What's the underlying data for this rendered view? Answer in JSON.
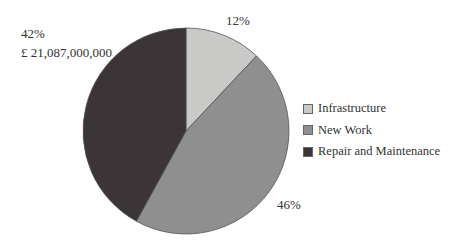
{
  "chart_data": {
    "type": "pie",
    "title": "",
    "categories": [
      "Infrastructure",
      "New Work",
      "Repair and Maintenance"
    ],
    "values": [
      12,
      46,
      42
    ],
    "units": "%",
    "colors": [
      "#c9c9c7",
      "#8f8f8f",
      "#3b3537"
    ],
    "annotations": [
      {
        "slice": "Infrastructure",
        "text": "12%"
      },
      {
        "slice": "New Work",
        "text": "46%"
      },
      {
        "slice": "Repair and Maintenance",
        "text": "42%",
        "subtext": "£ 21,087,000,000"
      }
    ],
    "start_angle": "12 o'clock",
    "direction": "clockwise",
    "legend_position": "right"
  },
  "labels": {
    "infrastructure_pct": "12%",
    "new_work_pct": "46%",
    "repair_pct": "42%",
    "repair_value": "£ 21,087,000,000"
  },
  "legend": {
    "items": [
      {
        "label": "Infrastructure",
        "color": "#c9c9c7"
      },
      {
        "label": "New Work",
        "color": "#8f8f8f"
      },
      {
        "label": "Repair and Maintenance",
        "color": "#3b3537"
      }
    ]
  }
}
